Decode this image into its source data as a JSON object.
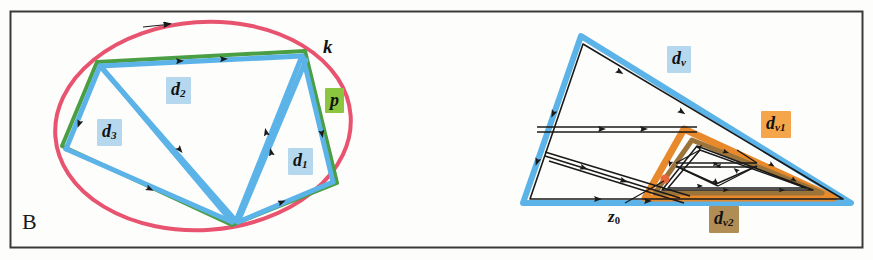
{
  "figure": {
    "panel_letter": "B",
    "background_color": "#fdfdfc",
    "frame_color": "#3a3a3a"
  },
  "palette": {
    "pink": "#e8536f",
    "green": "#4a9e43",
    "blue": "#5bb3e8",
    "orange": "#e8892b",
    "brown": "#9c7339",
    "black": "#1a1a1a",
    "label_blue_bg": "#b6d8ef",
    "label_green_bg": "#8cc63f",
    "label_orange_bg": "#f5a council",
    "label_brown_bg": "#b08d55"
  },
  "left_diagram": {
    "labels": [
      {
        "id": "k",
        "text": "k",
        "sub": "",
        "bg": "none",
        "x": 323,
        "y": 44,
        "size": 18
      },
      {
        "id": "p",
        "text": "p",
        "sub": "",
        "bg": "#8cc63f",
        "x": 328,
        "y": 96,
        "size": 17
      },
      {
        "id": "d2",
        "text": "d",
        "sub": "2",
        "bg": "#b6d8ef",
        "x": 168,
        "y": 84,
        "size": 17
      },
      {
        "id": "d3",
        "text": "d",
        "sub": "3",
        "bg": "#b6d8ef",
        "x": 99,
        "y": 126,
        "size": 17
      },
      {
        "id": "d1",
        "text": "d",
        "sub": "1",
        "bg": "#b6d8ef",
        "x": 290,
        "y": 155,
        "size": 17
      }
    ],
    "shapes": {
      "ellipse_k": {
        "cx": 203,
        "cy": 126,
        "rx": 148,
        "ry": 106,
        "rotate": -3,
        "color": "#e8536f",
        "width": 4
      },
      "pentagon_p": {
        "points": "97,62 305,51 337,183 232,225 62,146",
        "color": "#4a9e43",
        "width": 4
      },
      "cycles": [
        {
          "name": "d1",
          "color": "#5bb3e8",
          "width": 5
        },
        {
          "name": "d2",
          "color": "#5bb3e8",
          "width": 5
        },
        {
          "name": "d3",
          "color": "#5bb3e8",
          "width": 5
        }
      ]
    }
  },
  "right_diagram": {
    "labels": [
      {
        "id": "dv",
        "text": "d",
        "sub": "v",
        "bg": "#b6d8ef",
        "x": 669,
        "y": 53,
        "size": 17
      },
      {
        "id": "dv1",
        "text": "d",
        "sub": "v1",
        "bg": "#f5a councilx",
        "x": 763,
        "y": 118,
        "size": 17
      },
      {
        "id": "dv2",
        "text": "d",
        "sub": "v2",
        "bg": "#b08d55",
        "x": 711,
        "y": 213,
        "size": 17
      },
      {
        "id": "z0",
        "text": "z",
        "sub": "0",
        "bg": "none",
        "x": 610,
        "y": 209,
        "size": 16
      }
    ],
    "shapes": {
      "outer_triangle_dv": {
        "points": "581,36 851,203 523,203",
        "color": "#5bb3e8",
        "width": 5
      },
      "inner_triangle_dv1": {
        "points": "683,129 831,197 646,197",
        "color": "#e8892b",
        "width": 5
      },
      "inner_triangle_dv2": {
        "points": "690,136 821,193 654,193",
        "color": "#9c7339",
        "width": 4
      },
      "marker_z0": {
        "cx": 665,
        "cy": 180,
        "r": 4.5,
        "color": "#e8663a"
      },
      "leader_line_z0": {
        "x1": 625,
        "y1": 203,
        "x2": 664,
        "y2": 182,
        "color": "#1a1a1a",
        "width": 1.2
      }
    }
  }
}
